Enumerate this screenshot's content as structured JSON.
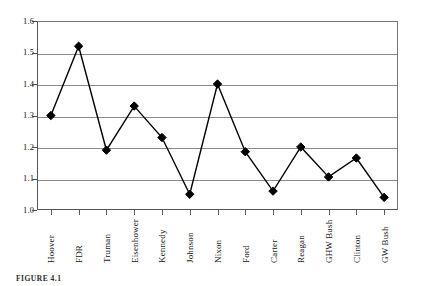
{
  "figure": {
    "caption": "FIGURE 4.1"
  },
  "chart_data": {
    "type": "line",
    "title": "",
    "xlabel": "",
    "ylabel": "",
    "ylim": [
      1.0,
      1.6
    ],
    "ytick_step": 0.1,
    "yticks": [
      "1.6",
      "1.5",
      "1.4",
      "1.3",
      "1.2",
      "1.1",
      "1.0"
    ],
    "ytick_values": [
      1.6,
      1.5,
      1.4,
      1.3,
      1.2,
      1.1,
      1.0
    ],
    "grid": "horizontal",
    "legend": "none",
    "marker": "diamond",
    "marker_color": "#000000",
    "line_color": "#000000",
    "grid_color": "#8a8a8a",
    "categories": [
      "Hoover",
      "FDR",
      "Truman",
      "Eisenhower",
      "Kennedy",
      "Johnson",
      "Nixon",
      "Ford",
      "Carter",
      "Reagan",
      "GHW Bush",
      "Clinton",
      "GW Bush"
    ],
    "values": [
      1.3,
      1.52,
      1.19,
      1.33,
      1.23,
      1.05,
      1.4,
      1.185,
      1.06,
      1.2,
      1.105,
      1.165,
      1.04
    ]
  }
}
